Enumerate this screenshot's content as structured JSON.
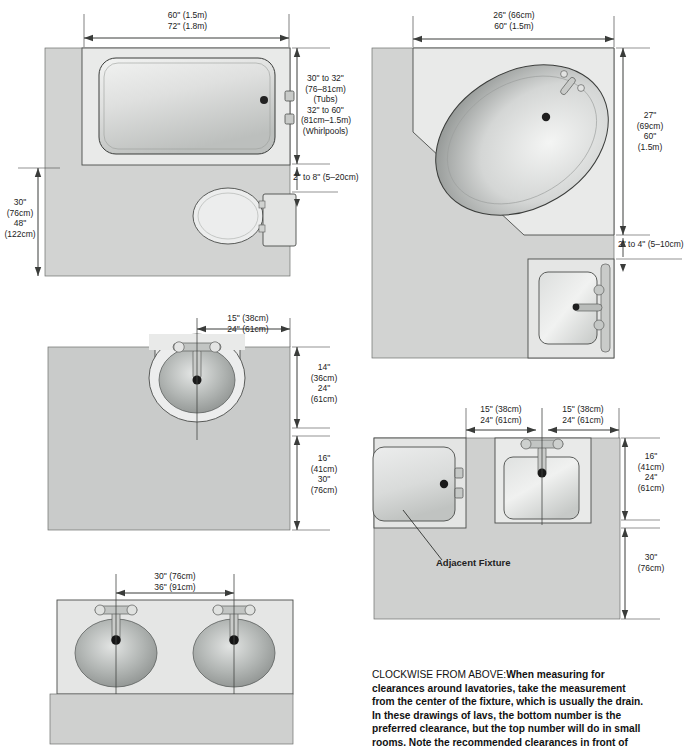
{
  "page": {
    "background": "#ffffff",
    "line_color": "#3a3a3a",
    "floor_fill": "#d2d3d2",
    "fixture_fill": "#e9eae9",
    "basin_fill": "#9fa2a0"
  },
  "diagrams": [
    {
      "id": "tub-toilet-plan",
      "name": "Tub and toilet plan",
      "position": "top-left",
      "labels": {
        "top": [
          "60\" (1.5m)",
          "72\" (1.8m)"
        ],
        "right_upper": [
          "30\" to 32\"",
          "(76–81cm)",
          "(Tubs)",
          "32\" to 60\"",
          "(81cm–1.5m)",
          "(Whirlpools)"
        ],
        "right_gap": "2\" to 8\" (5–20cm)",
        "left": [
          "30\"",
          "(76cm)",
          "48\"",
          "(122cm)"
        ]
      },
      "fixtures": [
        "bathtub",
        "toilet",
        "toilet-tank"
      ]
    },
    {
      "id": "corner-tub-plan",
      "name": "Corner tub and lavatory plan",
      "position": "top-right",
      "labels": {
        "top": [
          "26\" (66cm)",
          "60\" (1.5m)"
        ],
        "right_upper": [
          "27\"",
          "(69cm)",
          "60\"",
          "(1.5m)"
        ],
        "right_gap": "2\" to 4\" (5–10cm)"
      },
      "fixtures": [
        "oval-corner-tub",
        "faucet",
        "drain",
        "square-lavatory"
      ]
    },
    {
      "id": "oval-lav-plan",
      "name": "Single oval lavatory clearance plan",
      "position": "middle-left",
      "labels": {
        "top": [
          "15\" (38cm)",
          "24\" (61cm)"
        ],
        "right_upper": [
          "14\"",
          "(36cm)",
          "24\"",
          "(61cm)"
        ],
        "right_lower": [
          "16\"",
          "(41cm)",
          "30\"",
          "(76cm)"
        ]
      },
      "fixtures": [
        "oval-lavatory",
        "faucet",
        "drain"
      ]
    },
    {
      "id": "lav-adjacent-plan",
      "name": "Lavatory beside adjacent fixture plan",
      "position": "middle-right",
      "labels": {
        "top_left": [
          "15\" (38cm)",
          "24\" (61cm)"
        ],
        "top_right": [
          "15\" (38cm)",
          "24\" (61cm)"
        ],
        "right_upper": [
          "16\"",
          "(41cm)",
          "24\"",
          "(61cm)"
        ],
        "right_lower": [
          "30\"",
          "(76cm)"
        ],
        "annotation": "Adjacent Fixture"
      },
      "fixtures": [
        "square-lavatory",
        "faucet",
        "drain",
        "adjacent-tub"
      ]
    },
    {
      "id": "double-lav-plan",
      "name": "Double lavatory spacing plan",
      "position": "bottom-left",
      "labels": {
        "top": [
          "30\" (76cm)",
          "36\" (91cm)"
        ]
      },
      "fixtures": [
        "oval-lavatory-left",
        "oval-lavatory-right",
        "faucet",
        "drain"
      ]
    }
  ],
  "caption": {
    "lead": "CLOCKWISE FROM ABOVE:",
    "lines": [
      "When measuring for",
      "clearances around lavatories, take the measurement",
      "from the center of the fixture, which is usually the drain.",
      "In these drawings of lavs, the bottom number is the",
      "preferred clearance, but the top number will do in small",
      "rooms. Note the recommended clearances in front of"
    ]
  }
}
